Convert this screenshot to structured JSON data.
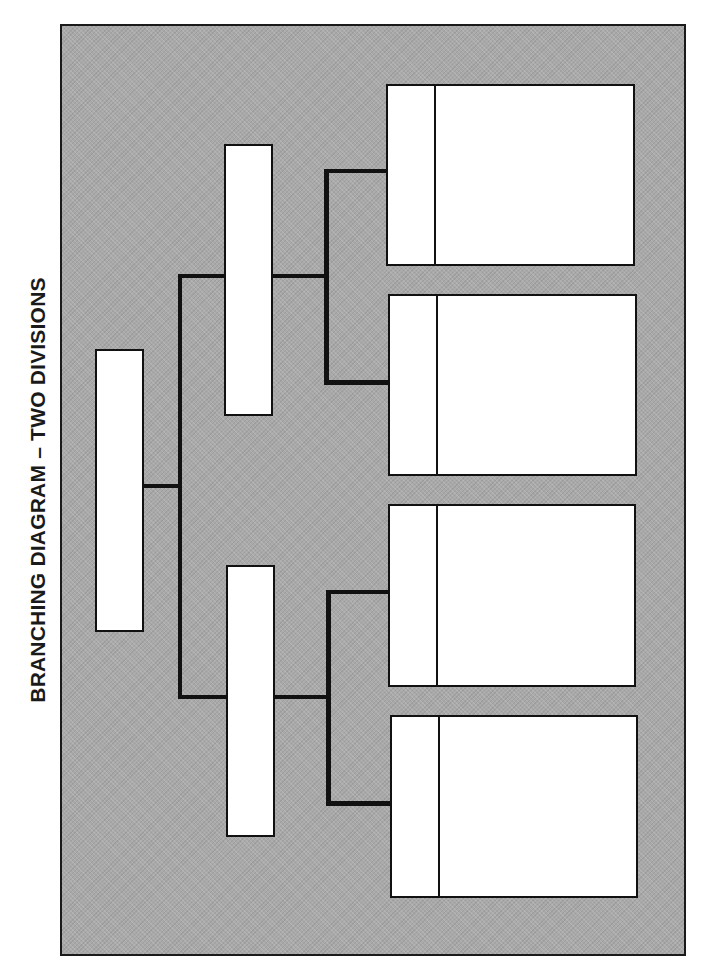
{
  "title": "BRANCHING DIAGRAM – TWO DIVISIONS",
  "colors": {
    "background_fill": "#a9a9a9",
    "box_fill": "#ffffff",
    "line_color": "#111111"
  },
  "diagram": {
    "root": {
      "label": ""
    },
    "divisions": [
      {
        "label": "",
        "leaves": [
          {
            "tab_label": "",
            "body_label": ""
          },
          {
            "tab_label": "",
            "body_label": ""
          }
        ]
      },
      {
        "label": "",
        "leaves": [
          {
            "tab_label": "",
            "body_label": ""
          },
          {
            "tab_label": "",
            "body_label": ""
          }
        ]
      }
    ]
  }
}
